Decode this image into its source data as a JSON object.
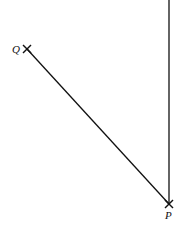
{
  "diagram": {
    "points": [
      {
        "label": "Q",
        "x": 27,
        "y": 49
      },
      {
        "label": "P",
        "x": 169,
        "y": 204
      }
    ],
    "segments": [
      {
        "from": "Q",
        "to": "P"
      },
      {
        "from": "P",
        "to": "top",
        "direction": "north"
      }
    ],
    "line_color": "#111111"
  }
}
